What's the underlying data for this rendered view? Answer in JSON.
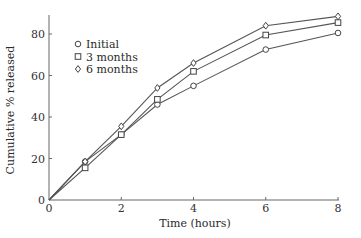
{
  "chart_data": {
    "type": "line",
    "title": "",
    "xlabel": "Time (hours)",
    "ylabel": "Cumulative % released",
    "xlim": [
      0,
      8
    ],
    "ylim": [
      0,
      90
    ],
    "x_ticks": [
      0,
      2,
      4,
      6,
      8
    ],
    "y_ticks": [
      0,
      20,
      40,
      60,
      80
    ],
    "grid": false,
    "legend_position": "upper left",
    "x": [
      0,
      1,
      2,
      3,
      4,
      6,
      8
    ],
    "series": [
      {
        "name": "Initial",
        "marker": "circle",
        "values": [
          0,
          18.5,
          31.5,
          46,
          55,
          72.5,
          80.5
        ]
      },
      {
        "name": "3 months",
        "marker": "square",
        "values": [
          0,
          15.5,
          31.5,
          48.5,
          62,
          79.5,
          85.5
        ]
      },
      {
        "name": "6 months",
        "marker": "diamond",
        "values": [
          0,
          18.5,
          35.5,
          54,
          66,
          84,
          88.5
        ]
      }
    ]
  }
}
